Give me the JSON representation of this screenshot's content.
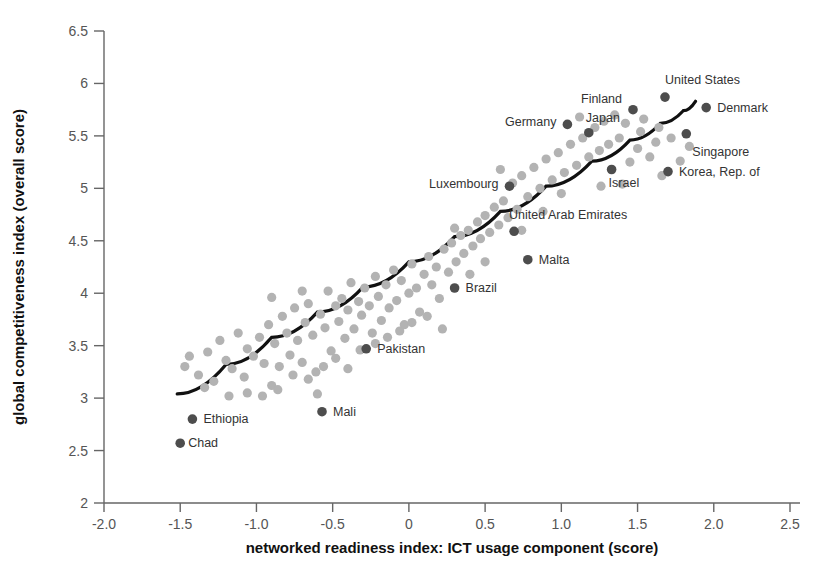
{
  "chart_data": {
    "type": "scatter",
    "title": "",
    "xlabel": "networked readiness index: ICT usage component (score)",
    "ylabel": "global competitiveness index (overall score)",
    "xlim": [
      -2.0,
      2.5
    ],
    "ylim": [
      2.0,
      6.5
    ],
    "xticks": [
      "-2.0",
      "-1.5",
      "-1.0",
      "-0.5",
      "0",
      "0.5",
      "1.0",
      "1.5",
      "2.0",
      "2.5"
    ],
    "xtick_values": [
      -2.0,
      -1.5,
      -1.0,
      -0.5,
      0,
      0.5,
      1.0,
      1.5,
      2.0,
      2.5
    ],
    "yticks": [
      "2",
      "2.5",
      "3",
      "3.5",
      "4",
      "4.5",
      "5",
      "5.5",
      "6",
      "6.5"
    ],
    "ytick_values": [
      2,
      2.5,
      3,
      3.5,
      4,
      4.5,
      5,
      5.5,
      6,
      6.5
    ],
    "grid": false,
    "legend": "none",
    "colors": {
      "unlabeled_point": "#b3b3b3",
      "labeled_point": "#4d4d4d",
      "trend_line": "#111111",
      "axis": "#666666",
      "tick_label": "#555555",
      "axis_title": "#111111",
      "point_label": "#333333"
    },
    "series": [
      {
        "name": "labeled countries",
        "point_color": "#4d4d4d",
        "points": [
          {
            "label": "Chad",
            "x": -1.5,
            "y": 2.57,
            "label_dx": 8,
            "label_dy": 4,
            "anchor": "start"
          },
          {
            "label": "Ethiopia",
            "x": -1.42,
            "y": 2.8,
            "label_dx": 11,
            "label_dy": 4,
            "anchor": "start"
          },
          {
            "label": "Mali",
            "x": -0.57,
            "y": 2.87,
            "label_dx": 11,
            "label_dy": 4,
            "anchor": "start"
          },
          {
            "label": "Pakistan",
            "x": -0.28,
            "y": 3.47,
            "label_dx": 11,
            "label_dy": 4,
            "anchor": "start"
          },
          {
            "label": "Brazil",
            "x": 0.3,
            "y": 4.05,
            "label_dx": 11,
            "label_dy": 4,
            "anchor": "start"
          },
          {
            "label": "Luxembourg",
            "x": 0.66,
            "y": 5.02,
            "label_dx": -11,
            "label_dy": 2,
            "anchor": "end"
          },
          {
            "label": "United Arab Emirates",
            "x": 0.69,
            "y": 4.59,
            "label_dx": -5,
            "label_dy": -12,
            "anchor": "start"
          },
          {
            "label": "Malta",
            "x": 0.78,
            "y": 4.32,
            "label_dx": 11,
            "label_dy": 4,
            "anchor": "start"
          },
          {
            "label": "Germany",
            "x": 1.04,
            "y": 5.61,
            "label_dx": -11,
            "label_dy": 2,
            "anchor": "end"
          },
          {
            "label": "Japan",
            "x": 1.18,
            "y": 5.53,
            "label_dx": -3,
            "label_dy": -11,
            "anchor": "start"
          },
          {
            "label": "Israel",
            "x": 1.33,
            "y": 5.18,
            "label_dx": -3,
            "label_dy": 17,
            "anchor": "start"
          },
          {
            "label": "Finland",
            "x": 1.47,
            "y": 5.75,
            "label_dx": -11,
            "label_dy": -7,
            "anchor": "end"
          },
          {
            "label": "United States",
            "x": 1.68,
            "y": 5.87,
            "label_dx": 0,
            "label_dy": -13,
            "anchor": "start"
          },
          {
            "label": "Korea, Rep. of",
            "x": 1.7,
            "y": 5.16,
            "label_dx": 11,
            "label_dy": 4,
            "anchor": "start"
          },
          {
            "label": "Singapore",
            "x": 1.82,
            "y": 5.52,
            "label_dx": 6,
            "label_dy": 22,
            "anchor": "start"
          },
          {
            "label": "Denmark",
            "x": 1.95,
            "y": 5.77,
            "label_dx": 11,
            "label_dy": 4,
            "anchor": "start"
          }
        ]
      },
      {
        "name": "other economies",
        "point_color": "#b3b3b3",
        "points": [
          {
            "x": -1.47,
            "y": 3.3
          },
          {
            "x": -1.38,
            "y": 3.22
          },
          {
            "x": -1.32,
            "y": 3.44
          },
          {
            "x": -1.28,
            "y": 3.16
          },
          {
            "x": -1.24,
            "y": 3.55
          },
          {
            "x": -1.2,
            "y": 3.36
          },
          {
            "x": -1.16,
            "y": 3.28
          },
          {
            "x": -1.12,
            "y": 3.62
          },
          {
            "x": -1.08,
            "y": 3.2
          },
          {
            "x": -1.06,
            "y": 3.47
          },
          {
            "x": -1.02,
            "y": 3.4
          },
          {
            "x": -0.98,
            "y": 3.58
          },
          {
            "x": -0.95,
            "y": 3.33
          },
          {
            "x": -0.92,
            "y": 3.7
          },
          {
            "x": -0.9,
            "y": 3.12
          },
          {
            "x": -0.88,
            "y": 3.52
          },
          {
            "x": -0.85,
            "y": 3.3
          },
          {
            "x": -0.83,
            "y": 3.78
          },
          {
            "x": -0.8,
            "y": 3.62
          },
          {
            "x": -0.78,
            "y": 3.41
          },
          {
            "x": -0.75,
            "y": 3.86
          },
          {
            "x": -0.73,
            "y": 3.55
          },
          {
            "x": -0.7,
            "y": 3.34
          },
          {
            "x": -0.68,
            "y": 3.72
          },
          {
            "x": -0.66,
            "y": 3.9
          },
          {
            "x": -0.63,
            "y": 3.6
          },
          {
            "x": -0.61,
            "y": 3.25
          },
          {
            "x": -0.58,
            "y": 3.8
          },
          {
            "x": -0.55,
            "y": 3.67
          },
          {
            "x": -0.53,
            "y": 4.02
          },
          {
            "x": -0.51,
            "y": 3.45
          },
          {
            "x": -0.48,
            "y": 3.88
          },
          {
            "x": -0.46,
            "y": 3.73
          },
          {
            "x": -0.44,
            "y": 3.95
          },
          {
            "x": -0.42,
            "y": 3.57
          },
          {
            "x": -0.4,
            "y": 3.84
          },
          {
            "x": -0.38,
            "y": 4.1
          },
          {
            "x": -0.36,
            "y": 3.66
          },
          {
            "x": -0.33,
            "y": 3.92
          },
          {
            "x": -0.31,
            "y": 3.79
          },
          {
            "x": -0.29,
            "y": 4.05
          },
          {
            "x": -0.26,
            "y": 3.88
          },
          {
            "x": -0.24,
            "y": 3.62
          },
          {
            "x": -0.22,
            "y": 4.16
          },
          {
            "x": -0.2,
            "y": 3.97
          },
          {
            "x": -0.18,
            "y": 3.74
          },
          {
            "x": -0.15,
            "y": 4.08
          },
          {
            "x": -0.13,
            "y": 3.86
          },
          {
            "x": -0.1,
            "y": 4.22
          },
          {
            "x": -0.08,
            "y": 3.93
          },
          {
            "x": -0.05,
            "y": 4.12
          },
          {
            "x": -0.03,
            "y": 3.7
          },
          {
            "x": 0.0,
            "y": 4.0
          },
          {
            "x": 0.02,
            "y": 4.28
          },
          {
            "x": 0.05,
            "y": 4.05
          },
          {
            "x": 0.07,
            "y": 3.82
          },
          {
            "x": 0.1,
            "y": 4.18
          },
          {
            "x": 0.13,
            "y": 4.35
          },
          {
            "x": 0.15,
            "y": 4.08
          },
          {
            "x": 0.18,
            "y": 4.25
          },
          {
            "x": 0.2,
            "y": 3.95
          },
          {
            "x": 0.23,
            "y": 4.42
          },
          {
            "x": 0.26,
            "y": 4.2
          },
          {
            "x": 0.28,
            "y": 4.48
          },
          {
            "x": 0.31,
            "y": 4.3
          },
          {
            "x": 0.34,
            "y": 4.55
          },
          {
            "x": 0.36,
            "y": 4.38
          },
          {
            "x": 0.39,
            "y": 4.6
          },
          {
            "x": 0.42,
            "y": 4.45
          },
          {
            "x": 0.45,
            "y": 4.68
          },
          {
            "x": 0.47,
            "y": 4.52
          },
          {
            "x": 0.5,
            "y": 4.74
          },
          {
            "x": 0.53,
            "y": 4.58
          },
          {
            "x": 0.56,
            "y": 4.82
          },
          {
            "x": 0.59,
            "y": 4.65
          },
          {
            "x": 0.62,
            "y": 4.88
          },
          {
            "x": 0.65,
            "y": 4.72
          },
          {
            "x": 0.68,
            "y": 5.05
          },
          {
            "x": 0.71,
            "y": 4.8
          },
          {
            "x": 0.74,
            "y": 5.12
          },
          {
            "x": 0.78,
            "y": 4.92
          },
          {
            "x": 0.82,
            "y": 5.2
          },
          {
            "x": 0.86,
            "y": 5.0
          },
          {
            "x": 0.9,
            "y": 5.28
          },
          {
            "x": 0.94,
            "y": 5.08
          },
          {
            "x": 0.98,
            "y": 5.34
          },
          {
            "x": 1.02,
            "y": 5.15
          },
          {
            "x": 1.06,
            "y": 5.42
          },
          {
            "x": 1.1,
            "y": 5.22
          },
          {
            "x": 1.14,
            "y": 5.48
          },
          {
            "x": 1.18,
            "y": 5.3
          },
          {
            "x": 1.22,
            "y": 5.58
          },
          {
            "x": 1.25,
            "y": 5.36
          },
          {
            "x": 1.28,
            "y": 5.64
          },
          {
            "x": 1.31,
            "y": 5.42
          },
          {
            "x": 1.35,
            "y": 5.7
          },
          {
            "x": 1.38,
            "y": 5.48
          },
          {
            "x": 1.42,
            "y": 5.62
          },
          {
            "x": 1.45,
            "y": 5.25
          },
          {
            "x": 1.5,
            "y": 5.38
          },
          {
            "x": 1.54,
            "y": 5.66
          },
          {
            "x": 1.58,
            "y": 5.3
          },
          {
            "x": 1.62,
            "y": 5.44
          },
          {
            "x": 1.66,
            "y": 5.12
          },
          {
            "x": 1.72,
            "y": 5.48
          },
          {
            "x": 1.78,
            "y": 5.26
          },
          {
            "x": 1.84,
            "y": 5.4
          },
          {
            "x": -1.06,
            "y": 3.05
          },
          {
            "x": -0.96,
            "y": 3.02
          },
          {
            "x": -0.86,
            "y": 3.08
          },
          {
            "x": -0.76,
            "y": 3.22
          },
          {
            "x": -0.66,
            "y": 3.18
          },
          {
            "x": -0.56,
            "y": 3.3
          },
          {
            "x": -0.48,
            "y": 3.38
          },
          {
            "x": -0.4,
            "y": 3.28
          },
          {
            "x": -0.32,
            "y": 3.46
          },
          {
            "x": -0.22,
            "y": 3.52
          },
          {
            "x": -0.14,
            "y": 3.58
          },
          {
            "x": -0.06,
            "y": 3.64
          },
          {
            "x": 0.02,
            "y": 3.72
          },
          {
            "x": 0.12,
            "y": 3.78
          },
          {
            "x": 0.22,
            "y": 3.66
          },
          {
            "x": 0.3,
            "y": 4.62
          },
          {
            "x": 0.4,
            "y": 4.18
          },
          {
            "x": 0.5,
            "y": 4.3
          },
          {
            "x": 0.6,
            "y": 5.18
          },
          {
            "x": 0.74,
            "y": 4.6
          },
          {
            "x": 0.88,
            "y": 4.78
          },
          {
            "x": 1.0,
            "y": 4.95
          },
          {
            "x": 1.12,
            "y": 5.68
          },
          {
            "x": 1.26,
            "y": 5.02
          },
          {
            "x": 1.4,
            "y": 5.04
          },
          {
            "x": 1.52,
            "y": 5.54
          },
          {
            "x": 1.64,
            "y": 5.58
          },
          {
            "x": -1.18,
            "y": 3.02
          },
          {
            "x": -1.34,
            "y": 3.1
          },
          {
            "x": -1.44,
            "y": 3.4
          },
          {
            "x": -0.7,
            "y": 4.02
          },
          {
            "x": -0.9,
            "y": 3.96
          },
          {
            "x": -0.6,
            "y": 3.04
          }
        ]
      }
    ],
    "trend_line": {
      "name": "fitted trend",
      "color": "#111111",
      "points": [
        {
          "x": -1.52,
          "y": 3.04
        },
        {
          "x": -1.2,
          "y": 3.32
        },
        {
          "x": -0.9,
          "y": 3.58
        },
        {
          "x": -0.6,
          "y": 3.82
        },
        {
          "x": -0.3,
          "y": 4.06
        },
        {
          "x": 0.0,
          "y": 4.3
        },
        {
          "x": 0.3,
          "y": 4.54
        },
        {
          "x": 0.6,
          "y": 4.78
        },
        {
          "x": 0.9,
          "y": 5.02
        },
        {
          "x": 1.2,
          "y": 5.26
        },
        {
          "x": 1.45,
          "y": 5.46
        },
        {
          "x": 1.65,
          "y": 5.62
        },
        {
          "x": 1.8,
          "y": 5.74
        },
        {
          "x": 1.88,
          "y": 5.83
        }
      ]
    }
  }
}
